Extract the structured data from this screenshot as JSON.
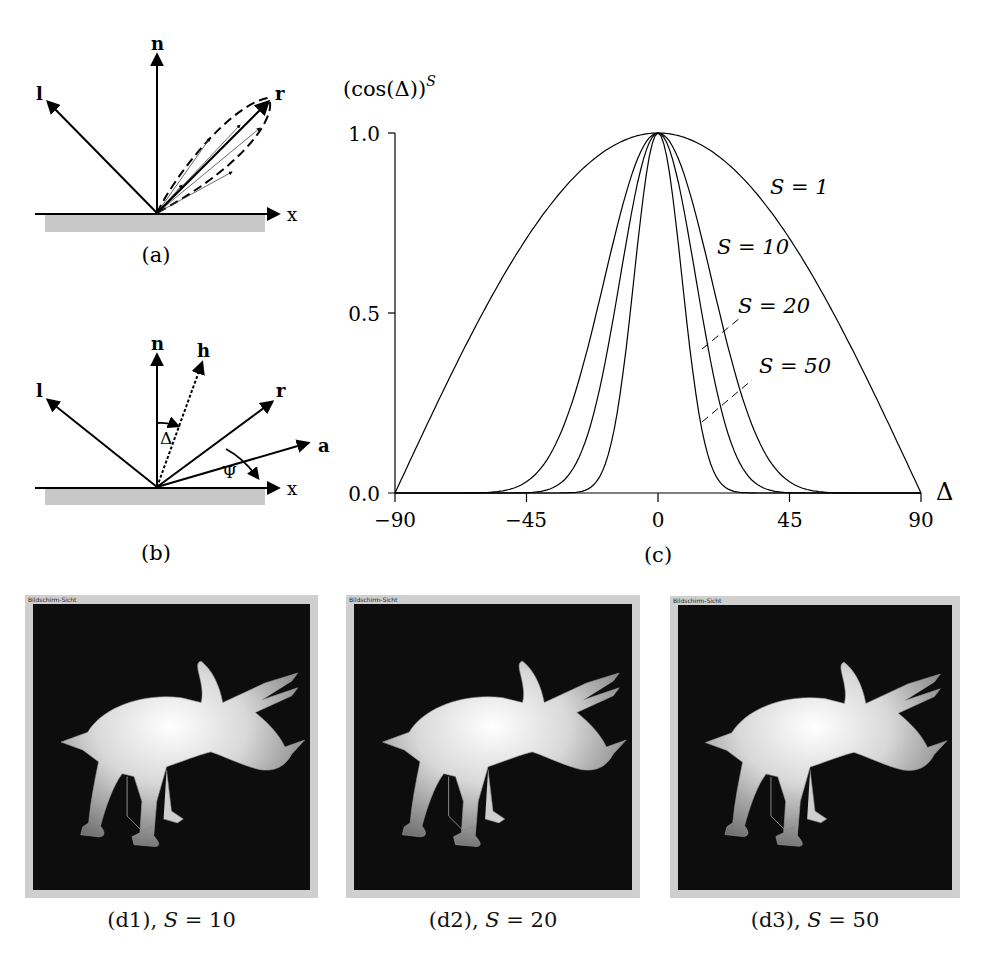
{
  "figure": {
    "panel_a": {
      "caption": "(a)",
      "vectors": {
        "light": "l",
        "normal": "n",
        "reflection": "r",
        "axis": "x"
      }
    },
    "panel_b": {
      "caption": "(b)",
      "vectors": {
        "light": "l",
        "normal": "n",
        "halfway": "h",
        "reflection": "r",
        "view": "a",
        "axis": "x"
      },
      "angles": {
        "delta": "Δ",
        "psi": "Ψ"
      }
    },
    "panel_c": {
      "caption": "(c)",
      "y_title": "(cos(Δ))",
      "y_title_sup": "S",
      "x_title": "Δ",
      "y_ticks": [
        "1.0",
        "0.5",
        "0.0"
      ],
      "x_ticks": [
        "−90",
        "−45",
        "0",
        "45",
        "90"
      ],
      "curve_labels": [
        "S = 1",
        "S = 10",
        "S = 20",
        "S = 50"
      ]
    },
    "renders": [
      {
        "window_title": "Bildschirm-Sicht",
        "caption_prefix": "(d1), ",
        "caption_var": "S",
        "caption_value": " = 10"
      },
      {
        "window_title": "Bildschirm-Sicht",
        "caption_prefix": "(d2), ",
        "caption_var": "S",
        "caption_value": " = 20"
      },
      {
        "window_title": "Bildschirm-Sicht",
        "caption_prefix": "(d3), ",
        "caption_var": "S",
        "caption_value": " = 50"
      }
    ]
  },
  "chart_data": {
    "type": "line",
    "title": "",
    "xlabel": "Δ",
    "ylabel": "(cos(Δ))^S",
    "xlim": [
      -90,
      90
    ],
    "ylim": [
      0,
      1
    ],
    "x_ticks": [
      -90,
      -45,
      0,
      45,
      90
    ],
    "y_ticks": [
      0.0,
      0.5,
      1.0
    ],
    "grid": false,
    "legend": "inline labels on right side of curves",
    "x": [
      -90,
      -75,
      -60,
      -45,
      -30,
      -20,
      -10,
      0,
      10,
      20,
      30,
      45,
      60,
      75,
      90
    ],
    "series": [
      {
        "name": "S = 1",
        "values": [
          0.0,
          0.26,
          0.5,
          0.71,
          0.87,
          0.94,
          0.98,
          1.0,
          0.98,
          0.94,
          0.87,
          0.71,
          0.5,
          0.26,
          0.0
        ]
      },
      {
        "name": "S = 10",
        "values": [
          0.0,
          0.0,
          0.0,
          0.03,
          0.24,
          0.54,
          0.86,
          1.0,
          0.86,
          0.54,
          0.24,
          0.03,
          0.0,
          0.0,
          0.0
        ]
      },
      {
        "name": "S = 20",
        "values": [
          0.0,
          0.0,
          0.0,
          0.0,
          0.06,
          0.29,
          0.74,
          1.0,
          0.74,
          0.29,
          0.06,
          0.0,
          0.0,
          0.0,
          0.0
        ]
      },
      {
        "name": "S = 50",
        "values": [
          0.0,
          0.0,
          0.0,
          0.0,
          0.0,
          0.04,
          0.47,
          1.0,
          0.47,
          0.04,
          0.0,
          0.0,
          0.0,
          0.0,
          0.0
        ]
      }
    ]
  }
}
